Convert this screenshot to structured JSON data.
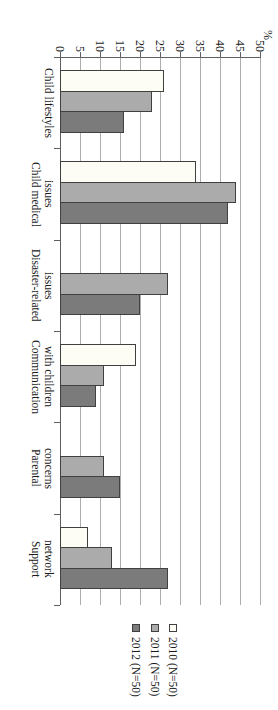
{
  "chart_data": {
    "type": "bar",
    "orientation": "rotated_90_clockwise_horizontal_bars",
    "title": "",
    "axis": {
      "unit_label": "%",
      "min": 0,
      "max": 50,
      "step": 5,
      "ticks": [
        0,
        5,
        10,
        15,
        20,
        25,
        30,
        35,
        40,
        45,
        50
      ]
    },
    "grid": "on",
    "legend_position": "bottom",
    "categories": [
      {
        "label": "Child lifestyles",
        "lines": [
          "Child lifestyles"
        ]
      },
      {
        "label": "Child medical issues",
        "lines": [
          "Child medical",
          "issues"
        ]
      },
      {
        "label": "Disaster-related issues",
        "lines": [
          "Disaster-related",
          "issues"
        ]
      },
      {
        "label": "Communication with children",
        "lines": [
          "Communication",
          "with children"
        ]
      },
      {
        "label": "Parental concerns",
        "lines": [
          "Parental",
          "concerns"
        ]
      },
      {
        "label": "Support network",
        "lines": [
          "Support",
          "network"
        ]
      }
    ],
    "series": [
      {
        "name": "2010 (N=50)",
        "color": "#fdfdf6",
        "values": [
          26,
          34,
          0,
          19,
          0,
          7
        ]
      },
      {
        "name": "2011 (N=50)",
        "color": "#ababab",
        "values": [
          23,
          44,
          27,
          11,
          11,
          13
        ]
      },
      {
        "name": "2012 (N=50)",
        "color": "#7b7b7b",
        "values": [
          16,
          42,
          20,
          9,
          15,
          27
        ]
      }
    ],
    "colors": {
      "bar_border": "#404040",
      "gridline": "#adadad",
      "axis": "#5f5f5f"
    }
  }
}
